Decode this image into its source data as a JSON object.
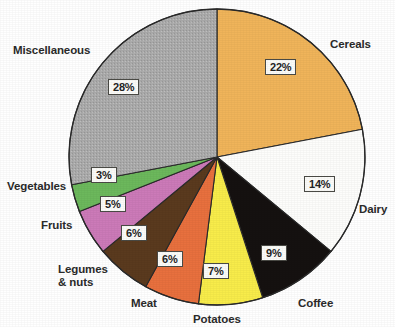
{
  "chart_data": {
    "type": "pie",
    "title": "",
    "subtitle": "",
    "xlabel": "",
    "ylabel": "",
    "legend_position": "none",
    "grid": false,
    "value_unit": "%",
    "start_angle_deg": 0,
    "direction": "clockwise",
    "total": 100,
    "categories": [
      "Cereals",
      "Dairy",
      "Coffee",
      "Potatoes",
      "Meat",
      "Legumes & nuts",
      "Fruits",
      "Vegetables",
      "Miscellaneous"
    ],
    "values": [
      22,
      14,
      9,
      7,
      6,
      6,
      5,
      3,
      28
    ],
    "value_labels": [
      "22%",
      "14%",
      "9%",
      "7%",
      "6%",
      "6%",
      "5%",
      "3%",
      "28%"
    ],
    "colors": [
      "#f0b45a",
      "#fdfdfb",
      "#151110",
      "#f8ec4a",
      "#e8703e",
      "#5a3a1e",
      "#cc7ab8",
      "#6cb85c",
      "#a8a8a8"
    ],
    "slices": [
      {
        "name": "Cereals",
        "label": "Cereals",
        "value": 22,
        "value_label": "22%",
        "color": "#f0b45a",
        "label_color": "#2b2b2b"
      },
      {
        "name": "Dairy",
        "label": "Dairy",
        "value": 14,
        "value_label": "14%",
        "color": "#fdfdfb",
        "label_color": "#2b2b2b"
      },
      {
        "name": "Coffee",
        "label": "Coffee",
        "value": 9,
        "value_label": "9%",
        "color": "#151110",
        "label_color": "#2b2b2b"
      },
      {
        "name": "Potatoes",
        "label": "Potatoes",
        "value": 7,
        "value_label": "7%",
        "color": "#f8ec4a",
        "label_color": "#2b2b2b"
      },
      {
        "name": "Meat",
        "label": "Meat",
        "value": 6,
        "value_label": "6%",
        "color": "#e8703e",
        "label_color": "#2b2b2b"
      },
      {
        "name": "Legumes & nuts",
        "label": "Legumes\n& nuts",
        "value": 6,
        "value_label": "6%",
        "color": "#5a3a1e",
        "label_color": "#2b2b2b"
      },
      {
        "name": "Fruits",
        "label": "Fruits",
        "value": 5,
        "value_label": "5%",
        "color": "#cc7ab8",
        "label_color": "#2b2b2b"
      },
      {
        "name": "Vegetables",
        "label": "Vegetables",
        "value": 3,
        "value_label": "3%",
        "color": "#6cb85c",
        "label_color": "#2b2b2b"
      },
      {
        "name": "Miscellaneous",
        "label": "Miscellaneous",
        "value": 28,
        "value_label": "28%",
        "color": "#a8a8a8",
        "label_color": "#2b2b2b"
      }
    ]
  },
  "labels": {
    "cereals": "Cereals",
    "dairy": "Dairy",
    "coffee": "Coffee",
    "potatoes": "Potatoes",
    "meat": "Meat",
    "legumes_line1": "Legumes",
    "legumes_line2": "& nuts",
    "fruits": "Fruits",
    "vegetables": "Vegetables",
    "miscellaneous": "Miscellaneous"
  },
  "values": {
    "cereals": "22%",
    "dairy": "14%",
    "coffee": "9%",
    "potatoes": "7%",
    "meat": "6%",
    "legumes": "6%",
    "fruits": "5%",
    "vegetables": "3%",
    "miscellaneous": "28%"
  },
  "style": {
    "outline_color": "#2a2a2a",
    "background": "#ffffff",
    "box_fill": "#fbfbf8",
    "box_border": "#4a4a45"
  },
  "geometry": {
    "center_x": 217,
    "center_y": 157,
    "radius": 148
  }
}
